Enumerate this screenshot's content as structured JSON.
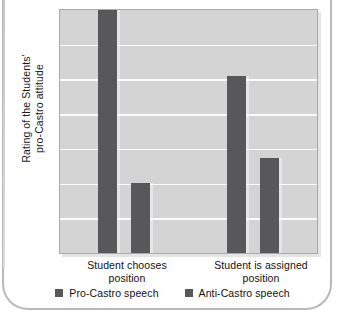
{
  "chart_data": {
    "type": "bar",
    "title": "",
    "subtitle": "",
    "xlabel": "",
    "ylabel": "Rating of the Students' pro-Castro attitude",
    "ylabel_line1": "Rating of the Students'",
    "ylabel_line2": "pro-Castro attitude",
    "categories": [
      "Student chooses position",
      "Student is assigned position"
    ],
    "category_lines": [
      {
        "line1": "Student chooses",
        "line2": "position"
      },
      {
        "line1": "Student is assigned",
        "line2": "position"
      }
    ],
    "series": [
      {
        "name": "Pro-Castro speech",
        "values": [
          100,
          73
        ]
      },
      {
        "name": "Anti-Castro speech",
        "values": [
          29,
          39
        ]
      }
    ],
    "ylim": [
      0,
      100
    ],
    "yticks": [],
    "ytick_labels": [],
    "gridlines": {
      "count": 6,
      "visible": true,
      "orientation": "horizontal",
      "color": "#fbfbfb"
    },
    "legend": {
      "position": "bottom",
      "entries": [
        {
          "label": "Pro-Castro speech",
          "color": "#58585a"
        },
        {
          "label": "Anti-Castro speech",
          "color": "#58585a"
        }
      ]
    },
    "colors": {
      "plot_background": "#d4d4d4",
      "bar": "#58585a",
      "gridline": "#fbfbfb",
      "plot_border": "#a9a9ab",
      "text": "#111111",
      "frame": "#b9b9bb"
    }
  }
}
